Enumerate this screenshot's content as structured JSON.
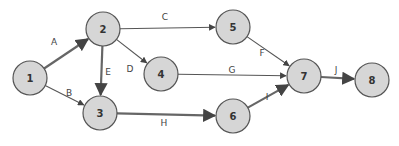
{
  "diagram": {
    "type": "activity-on-arrow network",
    "nodes": [
      {
        "id": "1",
        "label": "1",
        "x": 30,
        "y": 78
      },
      {
        "id": "2",
        "label": "2",
        "x": 103,
        "y": 29
      },
      {
        "id": "3",
        "label": "3",
        "x": 100,
        "y": 113
      },
      {
        "id": "4",
        "label": "4",
        "x": 161,
        "y": 74
      },
      {
        "id": "5",
        "label": "5",
        "x": 233,
        "y": 27
      },
      {
        "id": "6",
        "label": "6",
        "x": 233,
        "y": 116
      },
      {
        "id": "7",
        "label": "7",
        "x": 304,
        "y": 76
      },
      {
        "id": "8",
        "label": "8",
        "x": 372,
        "y": 80
      }
    ],
    "edges": [
      {
        "label": "A",
        "from": "1",
        "to": "2",
        "critical": true,
        "lx": 54,
        "ly": 42
      },
      {
        "label": "B",
        "from": "1",
        "to": "3",
        "critical": false,
        "lx": 69,
        "ly": 93
      },
      {
        "label": "C",
        "from": "2",
        "to": "5",
        "critical": false,
        "lx": 165,
        "ly": 17
      },
      {
        "label": "D",
        "from": "2",
        "to": "4",
        "critical": false,
        "lx": 130,
        "ly": 69
      },
      {
        "label": "E",
        "from": "2",
        "to": "3",
        "critical": true,
        "lx": 108,
        "ly": 72
      },
      {
        "label": "F",
        "from": "5",
        "to": "7",
        "critical": false,
        "lx": 262,
        "ly": 53
      },
      {
        "label": "G",
        "from": "4",
        "to": "7",
        "critical": false,
        "lx": 232,
        "ly": 70
      },
      {
        "label": "H",
        "from": "3",
        "to": "6",
        "critical": true,
        "lx": 164,
        "ly": 123
      },
      {
        "label": "I",
        "from": "6",
        "to": "7",
        "critical": true,
        "lx": 267,
        "ly": 97
      },
      {
        "label": "J",
        "from": "7",
        "to": "8",
        "critical": true,
        "lx": 336,
        "ly": 70
      }
    ]
  }
}
